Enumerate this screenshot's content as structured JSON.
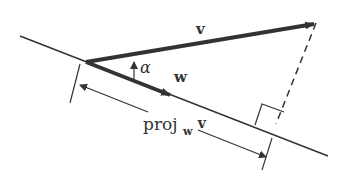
{
  "diagram": {
    "labels": {
      "v": "v",
      "w": "w",
      "alpha": "α",
      "proj": "proj",
      "proj_sub": "w",
      "proj_vec": "v"
    },
    "colors": {
      "line": "#333333",
      "vector": "#333333",
      "background": "#ffffff"
    }
  }
}
